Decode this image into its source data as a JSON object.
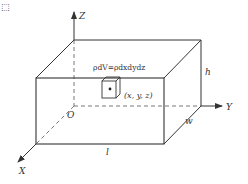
{
  "diagram": {
    "corner_mark": "⬚",
    "axes": {
      "z_label": "Z",
      "y_label": "Y",
      "x_label": "X",
      "origin_label": "O"
    },
    "dimensions": {
      "length_label": "l",
      "width_label": "w",
      "height_label": "h"
    },
    "element": {
      "mass_formula": "ρdV=ρdxdydz",
      "coordinates": "(x, y, z)"
    },
    "colors": {
      "line": "#333333",
      "background": "#ffffff"
    }
  }
}
